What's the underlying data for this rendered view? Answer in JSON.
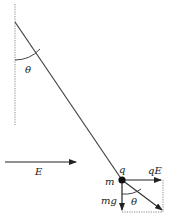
{
  "diagram": {
    "type": "charged-pendulum-in-electric-field",
    "labels": {
      "theta_top": "θ",
      "charge": "q",
      "mass": "m",
      "electric_force": "qE",
      "field": "E",
      "gravity": "mg",
      "theta_bottom": "θ"
    },
    "colors": {
      "line": "#333333",
      "dotted": "#888888",
      "mass": "#111111"
    }
  }
}
